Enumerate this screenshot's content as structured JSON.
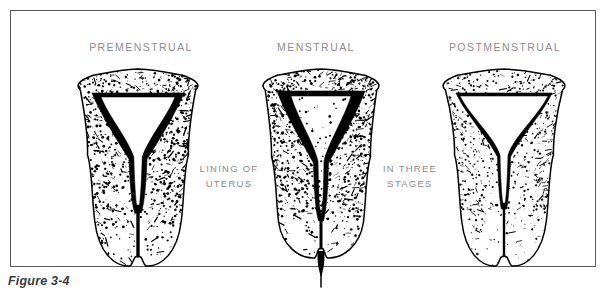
{
  "figure": {
    "caption": "Figure 3-4",
    "frame_color": "#58585a",
    "label_color": "#8d8d90",
    "ink_color": "#000000",
    "background": "#ffffff"
  },
  "headings": {
    "premenstrual": "PREMENSTRUAL",
    "menstrual": "MENSTRUAL",
    "postmenstrual": "POSTMENSTRUAL"
  },
  "mid_captions": {
    "left_line1": "LINING OF",
    "left_line2": "UTERUS",
    "right_line1": "IN THREE",
    "right_line2": "STAGES"
  },
  "illustrations": [
    {
      "name": "uterus-premenstrual",
      "stage": "premenstrual",
      "description": "Cross-section of uterus with thick, heavily stippled endometrial lining and a narrow triangular cavity",
      "lining_thickness": "thick",
      "cavity": "narrow-triangular",
      "flow": "none"
    },
    {
      "name": "uterus-menstrual",
      "stage": "menstrual",
      "description": "Cross-section of uterus with shedding endometrium, ragged dark lining and menstrual flow emerging at the cervix",
      "lining_thickness": "shedding",
      "cavity": "narrow-ragged",
      "flow": "present"
    },
    {
      "name": "uterus-postmenstrual",
      "stage": "postmenstrual",
      "description": "Cross-section of uterus with thin regenerated lining and a wide open cavity",
      "lining_thickness": "thin",
      "cavity": "wide-open",
      "flow": "none"
    }
  ]
}
